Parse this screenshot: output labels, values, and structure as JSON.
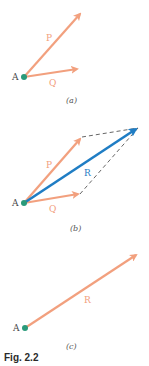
{
  "colors": {
    "force": "#F2A07E",
    "resultant": "#1F7DC4",
    "point": "#2A9A7A",
    "dashed": "#555555",
    "label_text": "#444444"
  },
  "panels": [
    {
      "id": "a",
      "sublabel": "(a)",
      "point_label": "A",
      "vectors": [
        {
          "name": "P",
          "label": "P",
          "from": [
            24,
            77
          ],
          "to": [
            82,
            12
          ]
        },
        {
          "name": "Q",
          "label": "Q",
          "from": [
            24,
            77
          ],
          "to": [
            79,
            69
          ]
        }
      ]
    },
    {
      "id": "b",
      "sublabel": "(b)",
      "point_label": "A",
      "vectors": [
        {
          "name": "P",
          "label": "P",
          "from": [
            24,
            203
          ],
          "to": [
            82,
            137
          ]
        },
        {
          "name": "Q",
          "label": "Q",
          "from": [
            24,
            203
          ],
          "to": [
            80,
            194
          ]
        },
        {
          "name": "R",
          "label": "R",
          "from": [
            24,
            203
          ],
          "to": [
            138,
            128
          ]
        }
      ],
      "dashed_lines": [
        {
          "from": [
            82,
            137
          ],
          "to": [
            138,
            128
          ]
        },
        {
          "from": [
            80,
            194
          ],
          "to": [
            138,
            128
          ]
        }
      ]
    },
    {
      "id": "c",
      "sublabel": "(c)",
      "point_label": "A",
      "vectors": [
        {
          "name": "R",
          "label": "R",
          "from": [
            25,
            328
          ],
          "to": [
            138,
            254
          ]
        }
      ]
    }
  ],
  "caption": "Fig. 2.2"
}
